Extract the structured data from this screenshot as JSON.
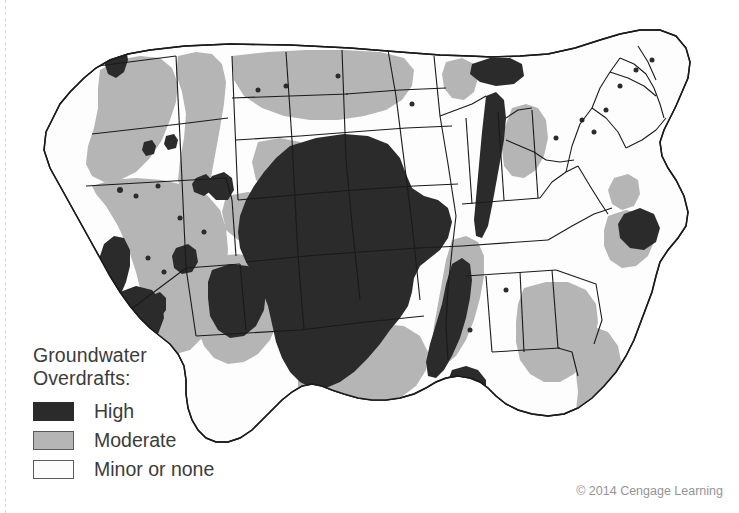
{
  "figure": {
    "kind": "thematic-choropleth-map",
    "region": "Contiguous United States",
    "background_color": "#ffffff"
  },
  "legend": {
    "title_line1": "Groundwater",
    "title_line2": "Overdrafts:",
    "items": [
      {
        "key": "high",
        "label": "High",
        "color": "#2b2b2b"
      },
      {
        "key": "moderate",
        "label": "Moderate",
        "color": "#b5b5b5"
      },
      {
        "key": "minor",
        "label": "Minor or none",
        "color": "#fdfdfd"
      }
    ]
  },
  "credit": {
    "text": "© 2014 Cengage Learning"
  },
  "map_data": {
    "type": "choropleth",
    "classes": [
      "High",
      "Moderate",
      "Minor or none"
    ],
    "class_colors": {
      "High": "#2b2b2b",
      "Moderate": "#b5b5b5",
      "Minor or none": "#fdfdfd"
    },
    "outline_color": "#1a1a1a",
    "notes": "Shaded bands show relative groundwater overdraft intensity across the lower 48 states.",
    "high_overdraft_regions": [
      "High Plains / Ogallala Aquifer (Nebraska, Kansas, Oklahoma Panhandle, Texas Panhandle, eastern Colorado, eastern New Mexico)",
      "Central Valley, California",
      "Southern California / Mojave",
      "South-central Arizona",
      "Lower Mississippi River Valley (Arkansas, Mississippi, Louisiana)",
      "Coastal North Carolina",
      "Puget Sound lowlands, Washington",
      "Snake River Plain spots, Idaho",
      "Southwestern Nevada spots"
    ],
    "moderate_overdraft_regions": [
      "Columbia Plateau (eastern Washington, eastern Oregon)",
      "Great Basin (Nevada, western Utah)",
      "Idaho",
      "Arizona and western New Mexico",
      "Montana / Dakotas band",
      "Eastern Texas and Gulf Coast",
      "Florida and southern Georgia / Alabama",
      "Lower Michigan",
      "Coastal Carolinas and Virginia"
    ],
    "minor_or_none_regions": [
      "New England",
      "Mid-Atlantic interior",
      "Ohio Valley / Great Lakes interior",
      "Northern Rockies",
      "Appalachia"
    ]
  }
}
